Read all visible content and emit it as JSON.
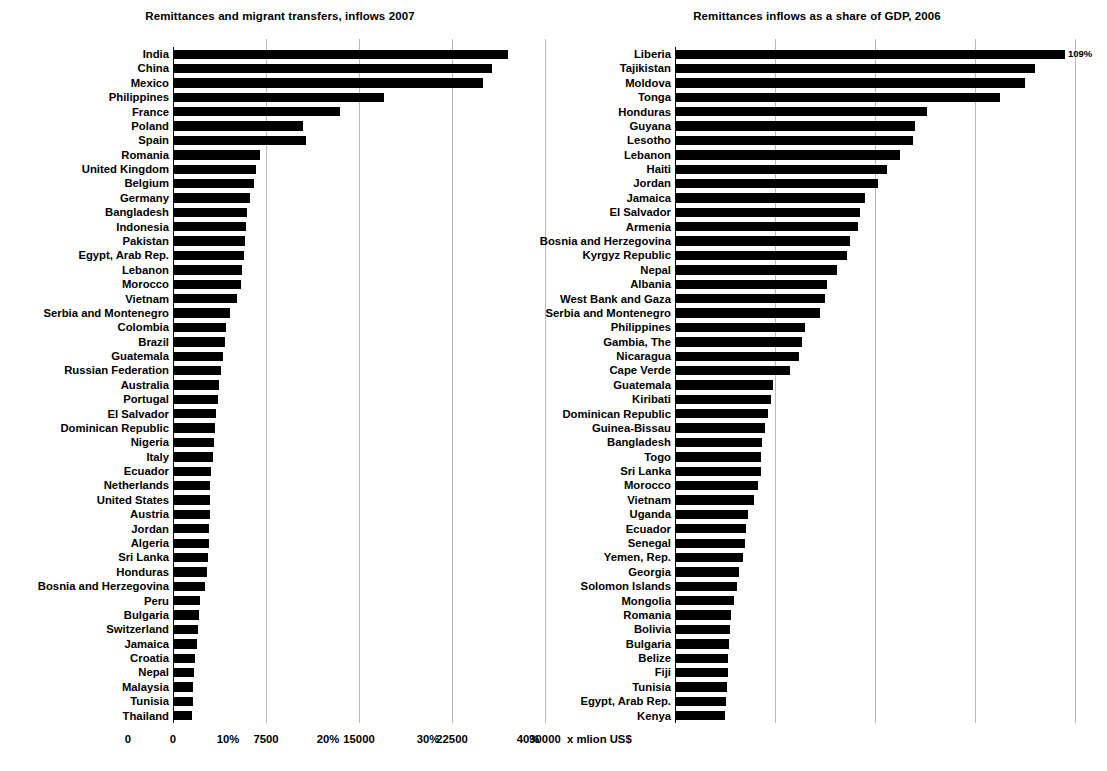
{
  "chart_data": [
    {
      "type": "bar",
      "orientation": "horizontal",
      "title": "Remittances and migrant transfers, inflows 2007",
      "xlabel": "x mlion US$",
      "ylabel": "",
      "xlim": [
        0,
        30000
      ],
      "xticks": [
        0,
        7500,
        15000,
        22500,
        30000
      ],
      "xticklabels": [
        "0",
        "7500",
        "15000",
        "22500",
        "30000"
      ],
      "grid": true,
      "legend": "none",
      "sort": "descending",
      "categories": [
        "India",
        "China",
        "Mexico",
        "Philippines",
        "France",
        "Poland",
        "Spain",
        "Romania",
        "United Kingdom",
        "Belgium",
        "Germany",
        "Bangladesh",
        "Indonesia",
        "Pakistan",
        "Egypt, Arab Rep.",
        "Lebanon",
        "Morocco",
        "Vietnam",
        "Serbia and Montenegro",
        "Colombia",
        "Brazil",
        "Guatemala",
        "Russian Federation",
        "Australia",
        "Portugal",
        "El Salvador",
        "Dominican Republic",
        "Nigeria",
        "Italy",
        "Ecuador",
        "Netherlands",
        "United States",
        "Austria",
        "Jordan",
        "Algeria",
        "Sri Lanka",
        "Honduras",
        "Bosnia and Herzegovina",
        "Peru",
        "Bulgaria",
        "Switzerland",
        "Jamaica",
        "Croatia",
        "Nepal",
        "Malaysia",
        "Tunisia",
        "Thailand"
      ],
      "values": [
        27000,
        25700,
        25000,
        17000,
        13500,
        10500,
        10700,
        7000,
        6700,
        6500,
        6200,
        6000,
        5900,
        5800,
        5700,
        5600,
        5500,
        5200,
        4600,
        4300,
        4200,
        4000,
        3900,
        3700,
        3600,
        3500,
        3400,
        3300,
        3200,
        3100,
        3000,
        3000,
        2950,
        2900,
        2900,
        2800,
        2750,
        2600,
        2200,
        2100,
        2000,
        1900,
        1800,
        1700,
        1650,
        1600,
        1500
      ]
    },
    {
      "type": "bar",
      "orientation": "horizontal",
      "title": "Remittances inflows as a share of GDP, 2006",
      "xlabel": "",
      "ylabel": "",
      "xlim": [
        0,
        40
      ],
      "xticks": [
        0,
        10,
        20,
        30,
        40
      ],
      "xticklabels": [
        "0",
        "10%",
        "20%",
        "30%",
        "40%"
      ],
      "grid": true,
      "legend": "none",
      "sort": "descending",
      "categories": [
        "Liberia",
        "Tajikistan",
        "Moldova",
        "Tonga",
        "Honduras",
        "Guyana",
        "Lesotho",
        "Lebanon",
        "Haiti",
        "Jordan",
        "Jamaica",
        "El Salvador",
        "Armenia",
        "Bosnia and Herzegovina",
        "Kyrgyz Republic",
        "Nepal",
        "Albania",
        "West Bank and Gaza",
        "Serbia and Montenegro",
        "Philippines",
        "Gambia, The",
        "Nicaragua",
        "Cape Verde",
        "Guatemala",
        "Kiribati",
        "Dominican Republic",
        "Guinea-Bissau",
        "Bangladesh",
        "Togo",
        "Sri Lanka",
        "Morocco",
        "Vietnam",
        "Uganda",
        "Ecuador",
        "Senegal",
        "Yemen, Rep.",
        "Georgia",
        "Solomon Islands",
        "Mongolia",
        "Romania",
        "Bolivia",
        "Bulgaria",
        "Belize",
        "Fiji",
        "Tunisia",
        "Egypt, Arab Rep.",
        "Kenya"
      ],
      "values": [
        39.0,
        36.0,
        35.0,
        32.5,
        25.2,
        24.0,
        23.8,
        22.5,
        21.2,
        20.3,
        19.0,
        18.5,
        18.3,
        17.5,
        17.2,
        16.2,
        15.2,
        15.0,
        14.5,
        13.0,
        12.7,
        12.4,
        11.5,
        9.8,
        9.6,
        9.3,
        9.0,
        8.7,
        8.6,
        8.6,
        8.3,
        7.9,
        7.3,
        7.1,
        7.0,
        6.8,
        6.4,
        6.2,
        5.9,
        5.6,
        5.5,
        5.4,
        5.3,
        5.3,
        5.2,
        5.1,
        5.0
      ],
      "value_labels": {
        "Liberia": "109%"
      }
    }
  ],
  "left_chart": {
    "title": "Remittances and migrant transfers, inflows 2007",
    "unit_label": "x mlion US$",
    "tick_labels": [
      "0",
      "7500",
      "15000",
      "22500",
      "30000"
    ]
  },
  "right_chart": {
    "title": "Remittances inflows as a share of GDP, 2006",
    "tick_labels": [
      "0",
      "10%",
      "20%",
      "30%",
      "40%"
    ],
    "liberia_value_label": "109%"
  },
  "colors": {
    "bar": "#000000",
    "grid": "#b9b9b9",
    "axis": "#000000",
    "background": "#ffffff",
    "text": "#000000"
  }
}
